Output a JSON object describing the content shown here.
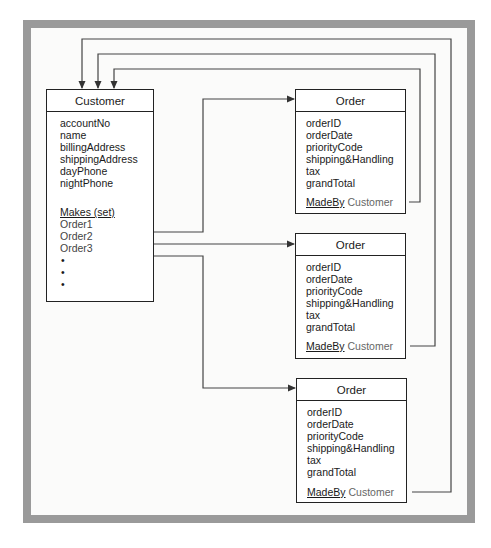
{
  "diagram": {
    "customer": {
      "title": "Customer",
      "attributes": [
        "accountNo",
        "name",
        "billingAddress",
        "shippingAddress",
        "dayPhone",
        "nightPhone"
      ],
      "set_label": "Makes (set)",
      "members": [
        "Order1",
        "Order2",
        "Order3"
      ],
      "ellipsis": [
        "•",
        "•",
        "•"
      ]
    },
    "orders": [
      {
        "title": "Order",
        "attributes": [
          "orderID",
          "orderDate",
          "priorityCode",
          "shipping&Handling",
          "tax",
          "grandTotal"
        ],
        "relation": "MadeBy",
        "relation_target": "Customer"
      },
      {
        "title": "Order",
        "attributes": [
          "orderID",
          "orderDate",
          "priorityCode",
          "shipping&Handling",
          "tax",
          "grandTotal"
        ],
        "relation": "MadeBy",
        "relation_target": "Customer"
      },
      {
        "title": "Order",
        "attributes": [
          "orderID",
          "orderDate",
          "priorityCode",
          "shipping&Handling",
          "tax",
          "grandTotal"
        ],
        "relation": "MadeBy",
        "relation_target": "Customer"
      }
    ],
    "colors": {
      "frame": "#9a9a9a",
      "background": "#fbfbfa",
      "line": "#333333"
    }
  }
}
